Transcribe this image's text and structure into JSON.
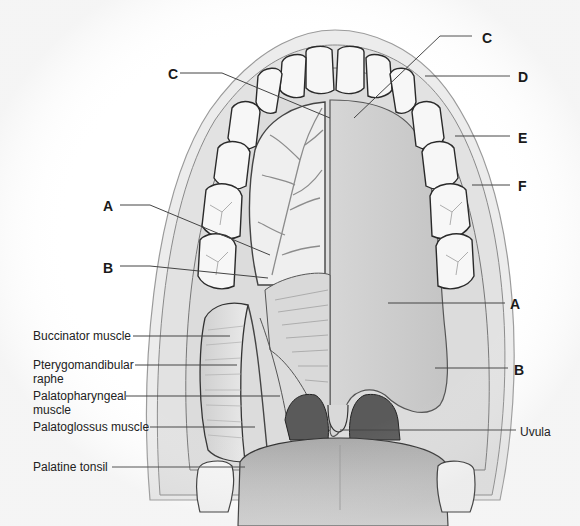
{
  "figure": {
    "letter_labels": [
      {
        "id": "C-left",
        "text": "C",
        "x": 168,
        "y": 66,
        "line": [
          [
            180,
            73
          ],
          [
            222,
            73
          ],
          [
            330,
            118
          ]
        ]
      },
      {
        "id": "C-right",
        "text": "C",
        "x": 482,
        "y": 30,
        "line": [
          [
            472,
            36
          ],
          [
            440,
            36
          ],
          [
            354,
            118
          ]
        ]
      },
      {
        "id": "D",
        "text": "D",
        "x": 518,
        "y": 69,
        "line": [
          [
            510,
            76
          ],
          [
            425,
            76
          ]
        ]
      },
      {
        "id": "E",
        "text": "E",
        "x": 518,
        "y": 130,
        "line": [
          [
            510,
            136
          ],
          [
            455,
            136
          ]
        ]
      },
      {
        "id": "F",
        "text": "F",
        "x": 518,
        "y": 178,
        "line": [
          [
            510,
            185
          ],
          [
            472,
            185
          ]
        ]
      },
      {
        "id": "A-left",
        "text": "A",
        "x": 103,
        "y": 198,
        "line": [
          [
            120,
            205
          ],
          [
            150,
            205
          ],
          [
            270,
            255
          ]
        ]
      },
      {
        "id": "B-left",
        "text": "B",
        "x": 103,
        "y": 260,
        "line": [
          [
            120,
            266
          ],
          [
            150,
            266
          ],
          [
            268,
            278
          ]
        ]
      },
      {
        "id": "A-right",
        "text": "A",
        "x": 510,
        "y": 296,
        "line": [
          [
            505,
            303
          ],
          [
            388,
            303
          ]
        ]
      },
      {
        "id": "B-right",
        "text": "B",
        "x": 514,
        "y": 362,
        "line": [
          [
            508,
            368
          ],
          [
            435,
            368
          ]
        ]
      }
    ],
    "text_labels": [
      {
        "id": "buccinator",
        "text": "Buccinator muscle",
        "x": 33,
        "y": 329,
        "line": [
          [
            133,
            336
          ],
          [
            230,
            336
          ]
        ]
      },
      {
        "id": "pterygomandibular",
        "text": "Pterygomandibular\nraphe",
        "x": 33,
        "y": 358,
        "line": [
          [
            135,
            365
          ],
          [
            237,
            365
          ]
        ]
      },
      {
        "id": "palatopharyngeal",
        "text": "Palatopharyngeal\nmuscle",
        "x": 33,
        "y": 389,
        "line": [
          [
            126,
            396
          ],
          [
            280,
            396
          ]
        ]
      },
      {
        "id": "palatoglossus",
        "text": "Palatoglossus muscle",
        "x": 33,
        "y": 420,
        "line": [
          [
            150,
            427
          ],
          [
            255,
            427
          ]
        ]
      },
      {
        "id": "palatine-tonsil",
        "text": "Palatine tonsil",
        "x": 33,
        "y": 460,
        "line": [
          [
            112,
            467
          ],
          [
            245,
            467
          ]
        ]
      },
      {
        "id": "uvula",
        "text": "Uvula",
        "x": 520,
        "y": 425,
        "line": [
          [
            516,
            430
          ],
          [
            340,
            430
          ]
        ]
      }
    ],
    "colors": {
      "line": "#444444",
      "tooth_fill": "#f7f7f7",
      "tooth_outline": "#2a2a2a",
      "palate": "#c9c9c9",
      "gum": "#d8d8d8",
      "tongue": "#bdbdbd",
      "pharynx": "#5a5a5a"
    }
  }
}
